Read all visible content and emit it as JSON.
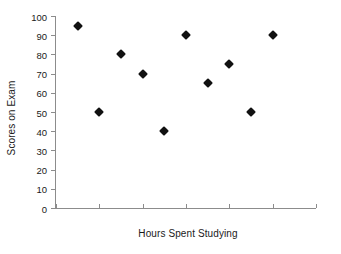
{
  "chart_data": {
    "type": "scatter",
    "title": "",
    "xlabel": "Hours Spent Studying",
    "ylabel": "Scores on Exam",
    "xlim": [
      0,
      12
    ],
    "ylim": [
      0,
      100
    ],
    "grid": false,
    "legend": null,
    "x_ticks": [
      0,
      2,
      4,
      6,
      8,
      10,
      12
    ],
    "y_ticks": [
      0,
      10,
      20,
      30,
      40,
      50,
      60,
      70,
      80,
      90,
      100
    ],
    "marker": "diamond",
    "marker_color": "#111111",
    "points": [
      {
        "x": 1,
        "y": 95
      },
      {
        "x": 2,
        "y": 50
      },
      {
        "x": 3,
        "y": 80
      },
      {
        "x": 4,
        "y": 70
      },
      {
        "x": 5,
        "y": 40
      },
      {
        "x": 6,
        "y": 90
      },
      {
        "x": 7,
        "y": 65
      },
      {
        "x": 8,
        "y": 75
      },
      {
        "x": 9,
        "y": 50
      },
      {
        "x": 10,
        "y": 90
      }
    ]
  },
  "axes": {
    "x_title": "Hours Spent Studying",
    "y_title": "Scores on Exam",
    "x_tick_labels": [
      "0",
      "2",
      "4",
      "6",
      "8",
      "10",
      "12"
    ],
    "y_tick_labels": [
      "0",
      "10",
      "20",
      "30",
      "40",
      "50",
      "60",
      "70",
      "80",
      "90",
      "100"
    ],
    "axis_color": "#8c8c8c"
  },
  "canvas": {
    "background": "#ffffff"
  }
}
